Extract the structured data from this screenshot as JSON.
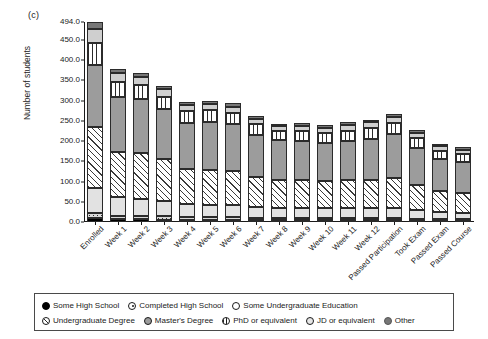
{
  "panel": {
    "label": "(c)"
  },
  "axes": {
    "ylabel": "Number of students",
    "yticks": [
      "0.0",
      "50.0",
      "100.0",
      "150.0",
      "200.0",
      "250.0",
      "300.0",
      "350.0",
      "400.0",
      "450.0",
      "494.0"
    ],
    "ymax": 494
  },
  "legend": {
    "row1": [
      {
        "key": "some_high_school",
        "label": "Some High School",
        "symbol": "filled-circle"
      },
      {
        "key": "completed_high_school",
        "label": "Completed High School",
        "symbol": "dotted-circle"
      },
      {
        "key": "some_undergraduate_education",
        "label": "Some Undergraduate Education",
        "symbol": "open-circle"
      }
    ],
    "row2": [
      {
        "key": "undergraduate_degree",
        "label": "Undergraduate Degree",
        "symbol": "diagonal-hatch-circle"
      },
      {
        "key": "masters_degree",
        "label": "Master's Degree",
        "symbol": "gray-circle"
      },
      {
        "key": "phd_or_equivalent",
        "label": "PhD or equivalent",
        "symbol": "vertical-hatch-circle"
      },
      {
        "key": "jd_or_equivalent",
        "label": "JD or equivalent",
        "symbol": "light-circle"
      },
      {
        "key": "other",
        "label": "Other",
        "symbol": "dark-gray-circle"
      }
    ]
  },
  "chart_data": {
    "type": "bar",
    "stacked": true,
    "title": "",
    "xlabel": "",
    "ylabel": "Number of students",
    "ylim": [
      0,
      494
    ],
    "grid": false,
    "legend_position": "bottom",
    "categories": [
      "Enrolled",
      "Week 1",
      "Week 2",
      "Week 3",
      "Week 4",
      "Week 5",
      "Week 6",
      "Week 7",
      "Week 8",
      "Week 9",
      "Week 10",
      "Week 11",
      "Week 12",
      "Passed Participation",
      "Took Exam",
      "Passed Exam",
      "Passed Course"
    ],
    "series": [
      {
        "name": "Some High School",
        "values": [
          10,
          7,
          7,
          6,
          5,
          5,
          5,
          4,
          4,
          4,
          4,
          4,
          4,
          4,
          3,
          3,
          3
        ]
      },
      {
        "name": "Completed High School",
        "values": [
          12,
          9,
          8,
          8,
          7,
          7,
          7,
          6,
          6,
          6,
          6,
          6,
          6,
          6,
          5,
          4,
          4
        ]
      },
      {
        "name": "Some Undergraduate Education",
        "values": [
          62,
          45,
          42,
          38,
          32,
          31,
          30,
          26,
          25,
          25,
          24,
          24,
          24,
          25,
          21,
          17,
          16
        ]
      },
      {
        "name": "Undergraduate Degree",
        "values": [
          150,
          112,
          113,
          104,
          86,
          85,
          83,
          74,
          70,
          68,
          67,
          69,
          70,
          74,
          62,
          52,
          49
        ]
      },
      {
        "name": "Master's Degree",
        "values": [
          154,
          137,
          134,
          123,
          115,
          118,
          116,
          105,
          98,
          97,
          95,
          98,
          102,
          108,
          93,
          79,
          76
        ]
      },
      {
        "name": "PhD or equivalent",
        "values": [
          53,
          36,
          34,
          31,
          28,
          30,
          29,
          26,
          22,
          24,
          24,
          25,
          26,
          28,
          24,
          21,
          20
        ]
      },
      {
        "name": "JD or equivalent",
        "values": [
          35,
          21,
          20,
          18,
          16,
          16,
          15,
          14,
          12,
          13,
          13,
          13,
          14,
          15,
          13,
          11,
          11
        ]
      },
      {
        "name": "Other",
        "values": [
          18,
          10,
          10,
          9,
          8,
          8,
          8,
          7,
          6,
          7,
          7,
          7,
          7,
          8,
          7,
          6,
          6
        ]
      }
    ],
    "totals": [
      494,
      377,
      368,
      337,
      297,
      300,
      293,
      262,
      243,
      244,
      240,
      246,
      253,
      268,
      228,
      193,
      185
    ]
  }
}
